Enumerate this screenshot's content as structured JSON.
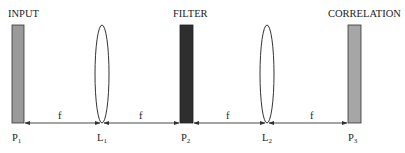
{
  "diagram": {
    "type": "4f optical correlator",
    "colors": {
      "input_plate": "#9a9a9a",
      "filter_plate": "#2e2e2e",
      "correlation_plate": "#a6a6a6",
      "line": "#333333"
    },
    "headings": {
      "input": "INPUT",
      "filter": "FILTER",
      "correlation": "CORRELATION"
    },
    "planes": [
      {
        "name": "P",
        "sub": "1"
      },
      {
        "name": "L",
        "sub": "1"
      },
      {
        "name": "P",
        "sub": "2"
      },
      {
        "name": "L",
        "sub": "2"
      },
      {
        "name": "P",
        "sub": "3"
      }
    ],
    "distances": [
      "f",
      "f",
      "f",
      "f"
    ]
  }
}
